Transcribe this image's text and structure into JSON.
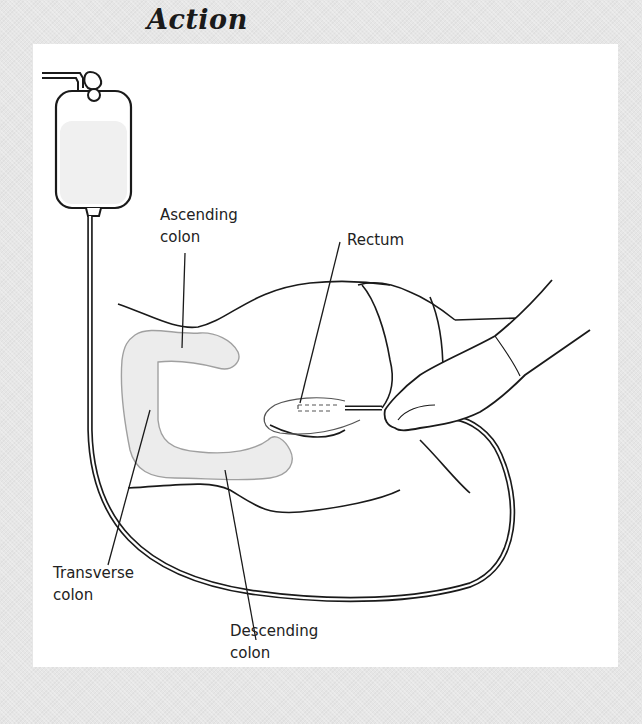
{
  "figure": {
    "title": "Action",
    "colors": {
      "frame": "#e6e6e6",
      "panel": "#ffffff",
      "line": "#1a1a1a",
      "colon_fill": "#ececec",
      "colon_outline": "#a0a0a0"
    },
    "labels": {
      "ascending_colon": {
        "line1": "Ascending",
        "line2": "colon"
      },
      "rectum": {
        "line1": "Rectum"
      },
      "transverse_colon": {
        "line1": "Transverse",
        "line2": "colon"
      },
      "descending_colon": {
        "line1": "Descending",
        "line2": "colon"
      }
    },
    "elements": [
      "enema-bag-icon",
      "tubing",
      "patient-body",
      "colon",
      "rectum",
      "gloved-hand-icon"
    ]
  }
}
